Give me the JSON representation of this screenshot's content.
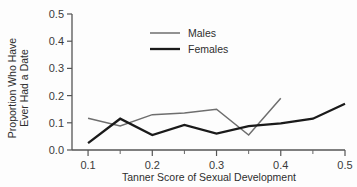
{
  "chart_data": {
    "type": "line",
    "title": "",
    "xlabel": "Tanner Score of Sexual Development",
    "ylabel_line1": "Proportion Who Have",
    "ylabel_line2": "Ever Had a Date",
    "xlim": [
      0.075,
      0.5
    ],
    "ylim": [
      0.0,
      0.5
    ],
    "xticks": [
      0.1,
      0.2,
      0.3,
      0.4,
      0.5
    ],
    "xtick_labels": [
      "0.1",
      "0.2",
      "0.3",
      "0.4",
      "0.5"
    ],
    "xminor_ticks": [
      0.15,
      0.25,
      0.35,
      0.45
    ],
    "yticks": [
      0.0,
      0.1,
      0.2,
      0.3,
      0.4,
      0.5
    ],
    "ytick_labels": [
      "0.0",
      "0.1",
      "0.2",
      "0.3",
      "0.4",
      "0.5"
    ],
    "grid": false,
    "legend_position": "upper center",
    "series": [
      {
        "name": "Males",
        "color": "#6e6e6e",
        "linewidth": 1.5,
        "x": [
          0.1,
          0.15,
          0.2,
          0.25,
          0.3,
          0.35,
          0.4
        ],
        "values": [
          0.117,
          0.088,
          0.13,
          0.136,
          0.15,
          0.055,
          0.19
        ]
      },
      {
        "name": "Females",
        "color": "#1a1a1a",
        "linewidth": 2.3,
        "x": [
          0.1,
          0.15,
          0.2,
          0.25,
          0.3,
          0.35,
          0.4,
          0.45,
          0.5
        ],
        "values": [
          0.025,
          0.115,
          0.055,
          0.092,
          0.06,
          0.088,
          0.098,
          0.115,
          0.17
        ]
      }
    ]
  },
  "legend": {
    "entries": [
      {
        "label": "Males"
      },
      {
        "label": "Females"
      }
    ]
  }
}
